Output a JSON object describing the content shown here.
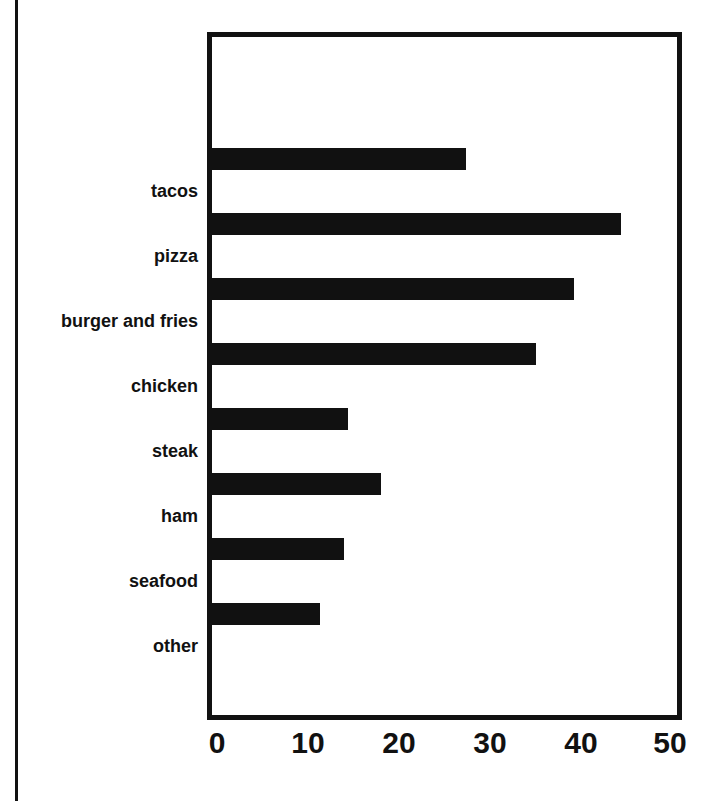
{
  "chart_data": {
    "type": "bar",
    "orientation": "horizontal",
    "title": "",
    "subtitle": "",
    "xlabel": "",
    "ylabel": "",
    "categories": [
      "tacos",
      "pizza",
      "burger and fries",
      "chicken",
      "steak",
      "ham",
      "seafood",
      "other"
    ],
    "values": [
      27,
      43.5,
      38.5,
      34.5,
      14.5,
      18,
      14,
      11.5
    ],
    "xlim": [
      0,
      50
    ],
    "xticks": [
      0,
      10,
      20,
      30,
      40,
      50
    ],
    "xtick_labels": [
      "0",
      "10",
      "20",
      "30",
      "40",
      "50"
    ],
    "grid": false,
    "legend": false,
    "bar_color": "#111111",
    "frame_color": "#111111",
    "background_color": "#ffffff"
  },
  "colors": {
    "bar": "#111111",
    "frame": "#111111",
    "text": "#111111",
    "background": "#ffffff"
  }
}
